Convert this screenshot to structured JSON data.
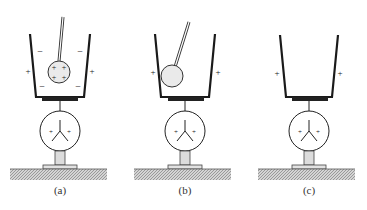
{
  "figure": {
    "panels": [
      {
        "id": "a",
        "label": "(a)",
        "description": "Charged ball lowered inside metal cup without touching; induced negative charges on inner wall, positive charges on outer wall; electroscope leaves diverge",
        "ball_charges": [
          "+",
          "+",
          "+",
          "+"
        ],
        "inner_wall_charges": [
          "−",
          "−",
          "−",
          "−"
        ],
        "outer_wall_charges": [
          "+",
          "+"
        ],
        "leaf_charges": [
          "+",
          "+"
        ],
        "ball_touching": false
      },
      {
        "id": "b",
        "label": "(b)",
        "description": "Ball touches inner wall of cup; inner charges neutralized, positive charges remain on outer wall; leaves remain diverged",
        "ball_charges": [],
        "inner_wall_charges": [],
        "outer_wall_charges": [
          "+",
          "+"
        ],
        "leaf_charges": [
          "+",
          "+"
        ],
        "ball_touching": true
      },
      {
        "id": "c",
        "label": "(c)",
        "description": "Ball removed; cup retains positive charge on outer surface; leaves remain diverged",
        "ball_charges": [],
        "inner_wall_charges": [],
        "outer_wall_charges": [
          "+",
          "+"
        ],
        "leaf_charges": [
          "+",
          "+"
        ],
        "ball_present": false
      }
    ],
    "colors": {
      "line": "#1a1a1a",
      "ball_fill": "#e6e6e6",
      "stem_fill": "#dcdcdc",
      "ground_fill": "#bdbdbd",
      "plate": "#222222"
    }
  }
}
